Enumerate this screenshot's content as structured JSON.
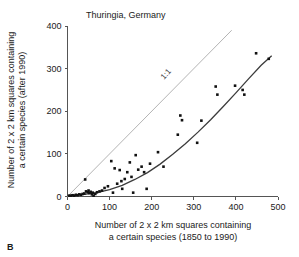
{
  "panel": {
    "label": "B"
  },
  "chart_data": {
    "type": "scatter",
    "title": "Thuringia, Germany",
    "xlabel": "Number of 2 x 2 km squares containing a certain species (1850 to 1990)",
    "xlabel_line1": "Number of 2 x 2 km squares containing",
    "xlabel_line2": "a certain species (1850 to 1990)",
    "ylabel": "Number of 2 x 2 km squares containing a certain species (after 1990)",
    "ylabel_line1": "Number of 2 x 2 km squares containing",
    "ylabel_line2": "a certain species (after 1990)",
    "xlim": [
      0,
      500
    ],
    "ylim": [
      0,
      400
    ],
    "xticks": [
      0,
      100,
      200,
      300,
      400,
      500
    ],
    "yticks": [
      0,
      100,
      200,
      300,
      400
    ],
    "grid": false,
    "legend": "none",
    "point_color": "#111111",
    "reference_line": {
      "label": "1:1",
      "color": "#b4b4b4",
      "x": [
        0,
        390
      ],
      "y": [
        0,
        390
      ]
    },
    "fit_curve": {
      "color": "#3c3c3c",
      "x": [
        5,
        40,
        70,
        100,
        130,
        160,
        190,
        220,
        250,
        280,
        310,
        340,
        370,
        400,
        430,
        460,
        485
      ],
      "y": [
        2,
        5,
        9,
        16,
        26,
        40,
        56,
        76,
        99,
        124,
        151,
        180,
        211,
        243,
        276,
        308,
        330
      ]
    },
    "points": [
      {
        "x": 4,
        "y": 2
      },
      {
        "x": 8,
        "y": 2
      },
      {
        "x": 12,
        "y": 3
      },
      {
        "x": 16,
        "y": 2
      },
      {
        "x": 20,
        "y": 4
      },
      {
        "x": 24,
        "y": 3
      },
      {
        "x": 28,
        "y": 5
      },
      {
        "x": 32,
        "y": 4
      },
      {
        "x": 36,
        "y": 6
      },
      {
        "x": 40,
        "y": 7
      },
      {
        "x": 42,
        "y": 40
      },
      {
        "x": 44,
        "y": 12
      },
      {
        "x": 48,
        "y": 10
      },
      {
        "x": 50,
        "y": 14
      },
      {
        "x": 52,
        "y": 8
      },
      {
        "x": 55,
        "y": 11
      },
      {
        "x": 58,
        "y": 5
      },
      {
        "x": 60,
        "y": 9
      },
      {
        "x": 62,
        "y": 2
      },
      {
        "x": 66,
        "y": 6
      },
      {
        "x": 70,
        "y": 10
      },
      {
        "x": 76,
        "y": 12
      },
      {
        "x": 82,
        "y": 14
      },
      {
        "x": 88,
        "y": 20
      },
      {
        "x": 96,
        "y": 24
      },
      {
        "x": 104,
        "y": 83
      },
      {
        "x": 108,
        "y": 9
      },
      {
        "x": 112,
        "y": 66
      },
      {
        "x": 118,
        "y": 30
      },
      {
        "x": 124,
        "y": 62
      },
      {
        "x": 128,
        "y": 36
      },
      {
        "x": 130,
        "y": 18
      },
      {
        "x": 136,
        "y": 41
      },
      {
        "x": 142,
        "y": 57
      },
      {
        "x": 148,
        "y": 80
      },
      {
        "x": 152,
        "y": 46
      },
      {
        "x": 156,
        "y": 9
      },
      {
        "x": 162,
        "y": 97
      },
      {
        "x": 168,
        "y": 63
      },
      {
        "x": 176,
        "y": 70
      },
      {
        "x": 182,
        "y": 57
      },
      {
        "x": 188,
        "y": 18
      },
      {
        "x": 196,
        "y": 77
      },
      {
        "x": 215,
        "y": 104
      },
      {
        "x": 228,
        "y": 70
      },
      {
        "x": 262,
        "y": 145
      },
      {
        "x": 268,
        "y": 190
      },
      {
        "x": 272,
        "y": 179
      },
      {
        "x": 308,
        "y": 126
      },
      {
        "x": 318,
        "y": 178
      },
      {
        "x": 352,
        "y": 258
      },
      {
        "x": 356,
        "y": 239
      },
      {
        "x": 398,
        "y": 260
      },
      {
        "x": 416,
        "y": 250
      },
      {
        "x": 420,
        "y": 239
      },
      {
        "x": 448,
        "y": 336
      },
      {
        "x": 478,
        "y": 323
      }
    ]
  }
}
